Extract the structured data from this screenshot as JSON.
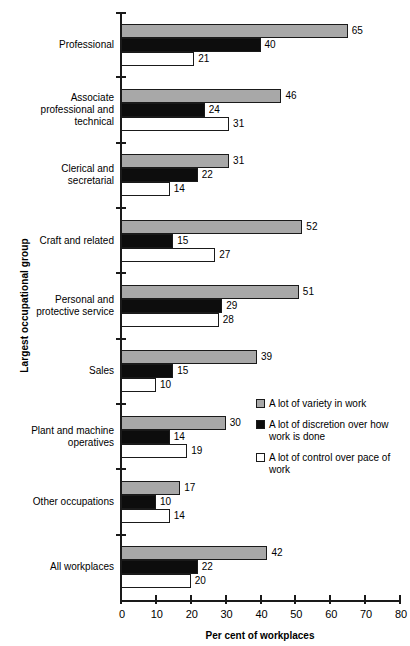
{
  "chart_data": {
    "type": "bar",
    "orientation": "horizontal",
    "title": "",
    "xlabel": "Per cent of workplaces",
    "ylabel": "Largest occupational group",
    "xlim": [
      0,
      80
    ],
    "xticks": [
      0,
      10,
      20,
      30,
      40,
      50,
      60,
      70,
      80
    ],
    "xtick_labels": [
      "0",
      "10",
      "20",
      "30",
      "40",
      "50",
      "60",
      "70",
      "80"
    ],
    "grid": false,
    "legend_position": "middle-right",
    "categories": [
      "Professional",
      "Associate professional and technical",
      "Clerical and secretarial",
      "Craft and related",
      "Personal and protective service",
      "Sales",
      "Plant and machine operatives",
      "Other occupations",
      "All workplaces"
    ],
    "category_lines": [
      [
        "Professional"
      ],
      [
        "Associate",
        "professional and",
        "technical"
      ],
      [
        "Clerical and",
        "secretarial"
      ],
      [
        "Craft and related"
      ],
      [
        "Personal and",
        "protective service"
      ],
      [
        "Sales"
      ],
      [
        "Plant and machine",
        "operatives"
      ],
      [
        "Other occupations"
      ],
      [
        "All workplaces"
      ]
    ],
    "series": [
      {
        "name": "A lot of variety in work",
        "key": "variety",
        "color": "#a8a8a8",
        "values": [
          65,
          46,
          31,
          52,
          51,
          39,
          30,
          17,
          42
        ]
      },
      {
        "name": "A lot of discretion over how work is done",
        "key": "discretion",
        "color": "#0d0d0d",
        "values": [
          40,
          24,
          22,
          15,
          29,
          15,
          14,
          10,
          22
        ]
      },
      {
        "name": "A lot of control over pace of work",
        "key": "control",
        "color": "#ffffff",
        "values": [
          21,
          31,
          14,
          27,
          28,
          10,
          19,
          14,
          20
        ]
      }
    ]
  },
  "legend": {
    "items": [
      {
        "label": "A lot of variety in work",
        "swatch": "variety"
      },
      {
        "label": "A lot of discretion over how work is done",
        "swatch": "discretion"
      },
      {
        "label": "A lot of control over pace of work",
        "swatch": "control"
      }
    ]
  },
  "axes": {
    "x_title": "Per cent of workplaces",
    "y_title": "Largest occupational group"
  }
}
